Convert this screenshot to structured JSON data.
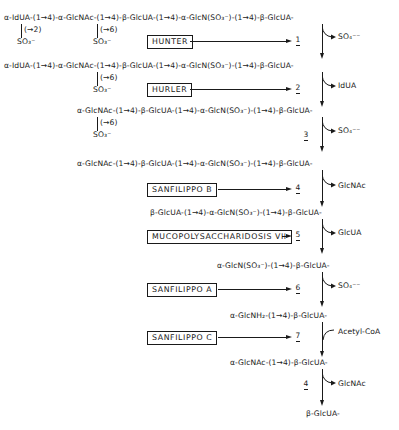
{
  "diagram": {
    "chains": {
      "c1": "α-IdUA-(1→4)-α-GlcNAc-(1→4)-β-GlcUA-(1→4)-α-GlcN(SO₃⁻)-(1→4)-β-GlcUA-",
      "c1_sub1_link": "(→2)",
      "c1_sub1_group": "SO₃⁻",
      "c1_sub2_link": "(→6)",
      "c1_sub2_group": "SO₃⁻",
      "c2": "α-IdUA-(1→4)-α-GlcNAc-(1→4)-β-GlcUA-(1→4)-α-GlcN(SO₃⁻)-(1→4)-β-GlcUA-",
      "c2_sub_link": "(→6)",
      "c2_sub_group": "SO₃⁻",
      "c3": "α-GlcNAc-(1→4)-β-GlcUA-(1→4)-α-GlcN(SO₃⁻)-(1→4)-β-GlcUA-",
      "c3_sub_link": "(→6)",
      "c3_sub_group": "SO₃⁻",
      "c4": "α-GlcNAc-(1→4)-β-GlcUA-(1→4)-α-GlcN(SO₃⁻)-(1→4)-β-GlcUA-",
      "c5": "β-GlcUA-(1→4)-α-GlcN(SO₃⁻)-(1→4)-β-GlcUA-",
      "c6": "α-GlcN(SO₃⁻)-(1→4)-β-GlcUA-",
      "c7": "α-GlcNH₂-(1→4)-β-GlcUA-",
      "c8": "α-GlcNAc-(1→4)-β-GlcUA-",
      "c9": "β-GlcUA-"
    },
    "diseases": [
      {
        "label": "HUNTER",
        "step": "1"
      },
      {
        "label": "HURLER",
        "step": "2"
      },
      {
        "label": "SANFILIPPO  B",
        "step": "4"
      },
      {
        "label": "MUCOPOLYSACCHARIDOSIS VII",
        "step": "5"
      },
      {
        "label": "SANFILIPPO  A",
        "step": "6"
      },
      {
        "label": "SANFILIPPO  C",
        "step": "7"
      }
    ],
    "steps": [
      {
        "num": "1",
        "product": "SO₄⁻⁻"
      },
      {
        "num": "2",
        "product": "IdUA"
      },
      {
        "num": "3",
        "product": "SO₄⁻⁻"
      },
      {
        "num": "4",
        "product": "GlcNAc"
      },
      {
        "num": "5",
        "product": "GlcUA"
      },
      {
        "num": "6",
        "product": "SO₄⁻⁻"
      },
      {
        "num": "7",
        "product": "Acetyl-CoA"
      },
      {
        "num": "4",
        "product": "GlcNAc"
      }
    ]
  }
}
